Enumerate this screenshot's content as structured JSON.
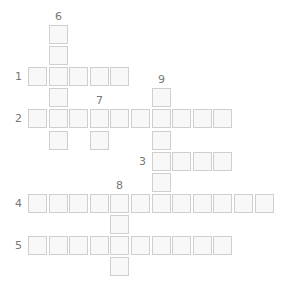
{
  "puzzle": {
    "type": "crossword",
    "layout": {
      "origin_x": 28,
      "origin_y": 25,
      "pitch_x": 20.6,
      "pitch_y": 21.1,
      "cell_size": 19
    },
    "colors": {
      "cell_border": "#cfcfcf",
      "cell_fill": "#f8f8f8",
      "number_text": "#777777"
    },
    "across": [
      {
        "number": "1",
        "row": 2,
        "col": 0,
        "length": 5
      },
      {
        "number": "2",
        "row": 4,
        "col": 0,
        "length": 10
      },
      {
        "number": "3",
        "row": 6,
        "col": 6,
        "length": 4
      },
      {
        "number": "4",
        "row": 8,
        "col": 0,
        "length": 12
      },
      {
        "number": "5",
        "row": 10,
        "col": 0,
        "length": 10
      }
    ],
    "down": [
      {
        "number": "6",
        "row": 0,
        "col": 1,
        "length": 6
      },
      {
        "number": "7",
        "row": 4,
        "col": 3,
        "length": 2
      },
      {
        "number": "8",
        "row": 8,
        "col": 4,
        "length": 4
      },
      {
        "number": "9",
        "row": 3,
        "col": 6,
        "length": 6
      }
    ]
  }
}
